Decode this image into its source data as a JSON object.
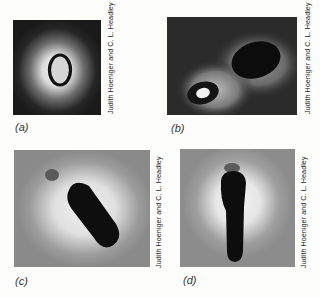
{
  "figure": {
    "panels": [
      {
        "id": "a",
        "label": "(a)",
        "credit": "Judith Hoeniger and C. L. Headley",
        "description": "phase-contrast micrograph of a single oval endospore with bright halo on dark background"
      },
      {
        "id": "b",
        "label": "(b)",
        "credit": "Judith Hoeniger and C. L. Headley",
        "description": "two cells: small refractile spore-like body with bright center and a larger dark oval body"
      },
      {
        "id": "c",
        "label": "(c)",
        "credit": "Judith Hoeniger and C. L. Headley",
        "description": "elongated dark cell lying diagonally with light halo on gray background"
      },
      {
        "id": "d",
        "label": "(d)",
        "credit": "Judith Hoeniger and C. L. Headley",
        "description": "vertical elongated dark cell with light halo on gray background"
      }
    ]
  }
}
